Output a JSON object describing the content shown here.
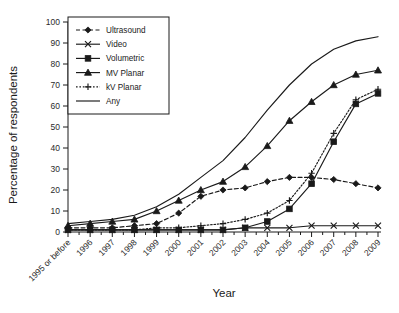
{
  "chart_data": {
    "type": "line",
    "title": "",
    "xlabel": "Year",
    "ylabel": "Percentage of respondents",
    "ylim": [
      0,
      100
    ],
    "ytick_step": 10,
    "yticks": [
      0,
      10,
      20,
      30,
      40,
      50,
      60,
      70,
      80,
      90,
      100
    ],
    "grid": false,
    "legend_position": "top-left",
    "categories": [
      "1995 or before",
      "1996",
      "1997",
      "1998",
      "1999",
      "2000",
      "2001",
      "2002",
      "2003",
      "2004",
      "2005",
      "2006",
      "2007",
      "2008",
      "2009"
    ],
    "series": [
      {
        "name": "Ultrasound",
        "marker": "diamond",
        "line_style": "dashed",
        "color": "#1a1a1a",
        "values": [
          2,
          2,
          2,
          3,
          4,
          9,
          17,
          20,
          21,
          24,
          26,
          26,
          25,
          23,
          21
        ]
      },
      {
        "name": "Video",
        "marker": "cross",
        "line_style": "solid",
        "color": "#1a1a1a",
        "values": [
          1,
          1,
          1,
          1,
          1,
          1,
          1,
          1,
          2,
          2,
          2,
          3,
          3,
          3,
          3
        ]
      },
      {
        "name": "Volumetric",
        "marker": "square",
        "line_style": "solid",
        "color": "#1a1a1a",
        "values": [
          1,
          1,
          1,
          1,
          1,
          1,
          1,
          1,
          2,
          5,
          11,
          23,
          43,
          61,
          66
        ]
      },
      {
        "name": "MV Planar",
        "marker": "triangle",
        "line_style": "solid",
        "color": "#1a1a1a",
        "values": [
          3,
          4,
          5,
          6,
          10,
          15,
          20,
          24,
          31,
          41,
          53,
          62,
          70,
          75,
          77
        ]
      },
      {
        "name": "kV Planar",
        "marker": "plus",
        "line_style": "dotted",
        "color": "#1a1a1a",
        "values": [
          1,
          1,
          1,
          1,
          2,
          2,
          3,
          4,
          6,
          9,
          15,
          28,
          47,
          63,
          68
        ]
      },
      {
        "name": "Any",
        "marker": "none",
        "line_style": "solid",
        "color": "#1a1a1a",
        "values": [
          4,
          5,
          6,
          8,
          12,
          18,
          26,
          34,
          45,
          58,
          70,
          80,
          87,
          91,
          93
        ]
      }
    ]
  }
}
